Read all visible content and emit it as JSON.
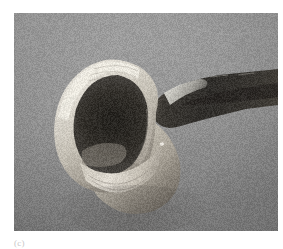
{
  "figure": {
    "panel_label": "(c)",
    "caption_color": "#c8c8c8",
    "photo": {
      "alt_name": "grayscale-micrograph",
      "subject": "rolled conical specimen with dark interior cavity and probe",
      "width_px": 264,
      "height_px": 218,
      "left_px": 14,
      "top_px": 13,
      "palette": {
        "background_top": "#a3a3a3",
        "background_bottom": "#7e7e7e",
        "specimen_highlight": "#e3e0d8",
        "specimen_midtone": "#b9b4a8",
        "specimen_shadow": "#6b6660",
        "cavity_dark": "#3a3732",
        "probe_dark": "#2e2c29",
        "probe_highlight": "#f0efe8",
        "border": "#ffffff"
      },
      "features": [
        {
          "name": "rolled-cone-body",
          "description": "large pale rolled cone occupying left-center"
        },
        {
          "name": "interior-cavity",
          "description": "dark recessed opening in the cone mouth"
        },
        {
          "name": "probe-rod",
          "description": "dark elongated rod entering from upper right"
        },
        {
          "name": "probe-tip-highlight",
          "description": "bright flare where rod meets cone rim"
        },
        {
          "name": "cone-tail",
          "description": "curved tapering tail sweeping to lower right"
        },
        {
          "name": "granular-background",
          "description": "noisy mid-gray substrate"
        }
      ]
    }
  }
}
